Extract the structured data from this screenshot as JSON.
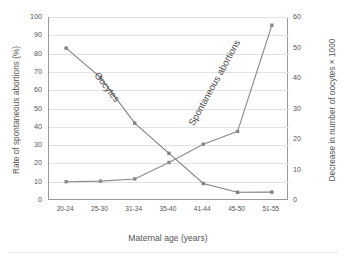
{
  "chart_data": {
    "type": "line",
    "title": "",
    "xlabel": "Maternal age (years)",
    "categories": [
      "20-24",
      "25-30",
      "31-34",
      "35-40",
      "41-44",
      "45-50",
      "51-55"
    ],
    "grid": true,
    "legend_position": "inline-annotations",
    "axes": {
      "left": {
        "label": "Rate of spontaneous abortions (%)",
        "ticks": [
          "0",
          "10",
          "20",
          "30",
          "40",
          "50",
          "60",
          "70",
          "80",
          "90",
          "100"
        ],
        "min": 0,
        "max": 100,
        "step": 10
      },
      "right": {
        "label": "Decrease in number of oocytes × 1000",
        "ticks": [
          "0",
          "10",
          "20",
          "30",
          "40",
          "50",
          "60"
        ],
        "min": 0,
        "max": 60,
        "step": 10
      }
    },
    "series": [
      {
        "name": "Oocytes",
        "axis": "left",
        "color": "#808080",
        "marker": "square",
        "values": [
          83,
          67,
          42,
          25.5,
          9,
          4.2,
          4.3
        ]
      },
      {
        "name": "Spontaneous abortions",
        "axis": "left",
        "color": "#8a8a8a",
        "marker": "square",
        "values": [
          10,
          10.3,
          11.5,
          20.5,
          30.5,
          37.5,
          95.5
        ]
      }
    ],
    "annotations": [
      {
        "text": "Oocytes",
        "rotation": 52
      },
      {
        "text": "Spontaneous abortions",
        "rotation": -61
      }
    ]
  }
}
